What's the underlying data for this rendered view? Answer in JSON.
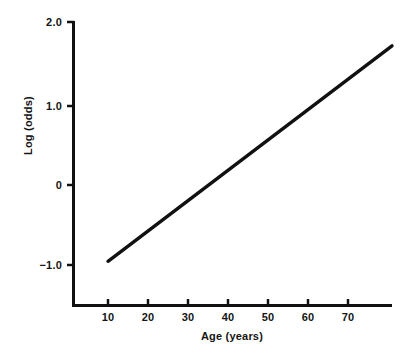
{
  "chart_data": {
    "type": "line",
    "title": "",
    "xlabel": "Age (years)",
    "ylabel": "Log (odds)",
    "xlim": [
      3,
      81
    ],
    "ylim": [
      -1.45,
      2.0
    ],
    "grid": false,
    "legend": "none",
    "xticks": [
      10,
      20,
      30,
      40,
      50,
      60,
      70
    ],
    "xtick_labels": [
      "10",
      "20",
      "30",
      "40",
      "50",
      "60",
      "70"
    ],
    "yticks": [
      2.0,
      1.0,
      0,
      -1.0
    ],
    "ytick_labels": [
      "2.0",
      "1.0",
      "0",
      "−1.0"
    ],
    "series": [
      {
        "name": "log odds vs age",
        "x": [
          10,
          20,
          30,
          40,
          50,
          60,
          70,
          81
        ],
        "values": [
          -0.96,
          -0.58,
          -0.2,
          0.18,
          0.56,
          0.94,
          1.32,
          1.75
        ]
      }
    ],
    "line_color": "#111111",
    "axis_color": "#111111",
    "background_color": "#ffffff"
  }
}
